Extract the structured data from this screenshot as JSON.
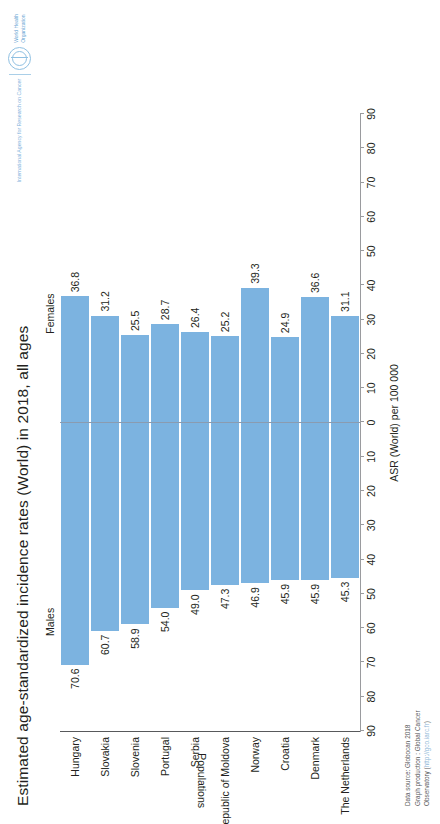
{
  "chart_data": {
    "type": "bar",
    "title": "Estimated age-standardized incidence rates (World) in 2018, all ages",
    "xlabel": "ASR (World) per 100 000",
    "ylabel": "Populations",
    "orientation": "horizontal-bidirectional",
    "categories": [
      "Hungary",
      "Slovakia",
      "Slovenia",
      "Portugal",
      "Serbia",
      "Republic of Moldova",
      "Norway",
      "Croatia",
      "Denmark",
      "The Netherlands"
    ],
    "series": [
      {
        "name": "Males",
        "side": "left",
        "values": [
          70.6,
          60.7,
          58.9,
          54.0,
          49.0,
          47.3,
          46.9,
          45.9,
          45.9,
          45.3
        ],
        "labels": [
          "70.6",
          "60.7",
          "58.9",
          "54.0",
          "49.0",
          "47.3",
          "46.9",
          "45.9",
          "45.9",
          "45.3"
        ]
      },
      {
        "name": "Females",
        "side": "right",
        "values": [
          36.8,
          31.2,
          25.5,
          28.7,
          26.4,
          25.2,
          39.3,
          24.9,
          36.6,
          31.1
        ],
        "labels": [
          "36.8",
          "31.2",
          "25.5",
          "28.7",
          "26.4",
          "25.2",
          "39.3",
          "24.9",
          "36.6",
          "31.1"
        ]
      }
    ],
    "xlim": [
      -90,
      90
    ],
    "tick_values": [
      -90,
      -80,
      -70,
      -60,
      -50,
      -40,
      -30,
      -20,
      -10,
      0,
      10,
      20,
      30,
      40,
      50,
      60,
      70,
      80,
      90
    ],
    "tick_labels": [
      "90",
      "80",
      "70",
      "60",
      "50",
      "40",
      "30",
      "20",
      "10",
      "0",
      "10",
      "20",
      "30",
      "40",
      "50",
      "60",
      "70",
      "80",
      "90"
    ],
    "grid": false,
    "legend_position": "inline-top",
    "bar_color": "#7cb3e0",
    "axis_color": "#58595b",
    "zero_line_color": "#8a9bb0"
  },
  "footer": {
    "line1": "Data source: Globocan 2018",
    "line2": "Graph production : Global Cancer",
    "line3_prefix": "Observatory (",
    "line3_link": "http://gco.iarc.fr",
    "line3_suffix": ")"
  },
  "logo": {
    "iarc": "International Agency for Research on Cancer",
    "who_line1": "World Health",
    "who_line2": "Organization"
  }
}
